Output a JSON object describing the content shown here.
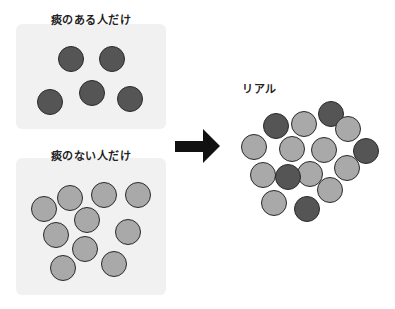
{
  "panels": [
    {
      "title": "痰のある人だけ",
      "title_pos": [
        91,
        11
      ],
      "box": [
        16,
        24,
        150,
        105
      ],
      "circles": [
        {
          "x": 71,
          "y": 59,
          "type": "dark"
        },
        {
          "x": 112,
          "y": 59,
          "type": "dark"
        },
        {
          "x": 50,
          "y": 102,
          "type": "dark"
        },
        {
          "x": 92,
          "y": 93,
          "type": "dark"
        },
        {
          "x": 130,
          "y": 99,
          "type": "dark"
        }
      ]
    },
    {
      "title": "痰のない人だけ",
      "title_pos": [
        91,
        147
      ],
      "box": [
        16,
        158,
        150,
        137
      ],
      "circles": [
        {
          "x": 44,
          "y": 209,
          "type": "light"
        },
        {
          "x": 70,
          "y": 198,
          "type": "light"
        },
        {
          "x": 104,
          "y": 195,
          "type": "light"
        },
        {
          "x": 138,
          "y": 195,
          "type": "light"
        },
        {
          "x": 87,
          "y": 220,
          "type": "light"
        },
        {
          "x": 56,
          "y": 235,
          "type": "light"
        },
        {
          "x": 128,
          "y": 232,
          "type": "light"
        },
        {
          "x": 85,
          "y": 249,
          "type": "light"
        },
        {
          "x": 63,
          "y": 268,
          "type": "light"
        },
        {
          "x": 114,
          "y": 264,
          "type": "light"
        }
      ]
    }
  ],
  "real": {
    "title": "リアル",
    "title_pos": [
      256,
      80
    ],
    "circles": [
      {
        "x": 276,
        "y": 126,
        "type": "dark"
      },
      {
        "x": 304,
        "y": 124,
        "type": "light"
      },
      {
        "x": 331,
        "y": 114,
        "type": "dark"
      },
      {
        "x": 348,
        "y": 129,
        "type": "light"
      },
      {
        "x": 254,
        "y": 147,
        "type": "light"
      },
      {
        "x": 292,
        "y": 149,
        "type": "light"
      },
      {
        "x": 324,
        "y": 150,
        "type": "light"
      },
      {
        "x": 366,
        "y": 151,
        "type": "dark"
      },
      {
        "x": 263,
        "y": 175,
        "type": "light"
      },
      {
        "x": 310,
        "y": 174,
        "type": "light"
      },
      {
        "x": 347,
        "y": 168,
        "type": "light"
      },
      {
        "x": 288,
        "y": 177,
        "type": "dark"
      },
      {
        "x": 330,
        "y": 190,
        "type": "light"
      },
      {
        "x": 274,
        "y": 203,
        "type": "light"
      },
      {
        "x": 307,
        "y": 209,
        "type": "dark"
      }
    ]
  },
  "arrow": {
    "direction": "right",
    "color": "#111111"
  },
  "colors": {
    "dark": "#555555",
    "light": "#a9a9a9",
    "panel": "#f1f1f1"
  }
}
